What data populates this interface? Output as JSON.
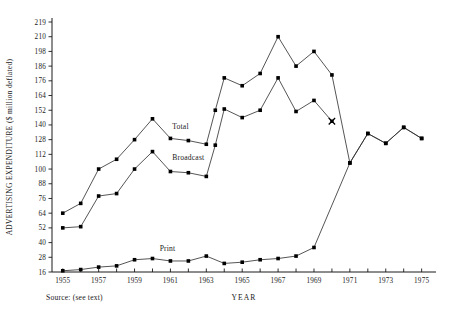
{
  "chart_data": {
    "type": "line",
    "title": "",
    "xlabel": "YEAR",
    "ylabel": "ADVERTISING EXPENDITURE ($ million deflated)",
    "source_note": "Source: (see text)",
    "grid": false,
    "legend_position": "inline-labels",
    "xlim": [
      1954.4,
      1975.8
    ],
    "ylim": [
      16,
      225
    ],
    "ytick_labels": [
      "16",
      "28",
      "40",
      "52",
      "64",
      "76",
      "88",
      "100",
      "112",
      "128",
      "140",
      "152",
      "164",
      "176",
      "186",
      "198",
      "210",
      "219"
    ],
    "ytick_values": [
      16,
      28,
      40,
      52,
      64,
      76,
      88,
      100,
      112,
      128,
      140,
      152,
      164,
      176,
      186,
      198,
      210,
      219
    ],
    "xtick_labels": [
      "1955",
      "1957",
      "1959",
      "1961",
      "1963",
      "1965",
      "1967",
      "1969",
      "1971",
      "1973",
      "1975"
    ],
    "xtick_values": [
      1955,
      1957,
      1959,
      1961,
      1963,
      1965,
      1967,
      1969,
      1971,
      1973,
      1975
    ],
    "x": [
      1955,
      1956,
      1957,
      1958,
      1959,
      1960,
      1961,
      1962,
      1963,
      1964,
      1965,
      1966,
      1967,
      1968,
      1969,
      1970,
      1971,
      1972,
      1973,
      1974,
      1975
    ],
    "series": [
      {
        "name": "Total",
        "label": "Total",
        "marker": "square",
        "values": [
          64,
          72,
          100,
          108,
          128,
          145,
          129,
          127,
          123,
          152,
          178,
          172,
          181,
          210,
          186,
          198,
          180,
          105,
          133,
          124,
          138,
          129
        ],
        "x_values": [
          1955,
          1956,
          1957,
          1958,
          1959,
          1960,
          1961,
          1962,
          1963,
          1963.5,
          1964,
          1965,
          1966,
          1967,
          1968,
          1969,
          1970,
          1971,
          1972,
          1973,
          1974,
          1975
        ]
      },
      {
        "name": "Broadcast",
        "label": "Broadcast",
        "marker": "square",
        "values": [
          52,
          53,
          78,
          80,
          100,
          115,
          98,
          97,
          94,
          122,
          153,
          146,
          152,
          178,
          151,
          160,
          143
        ],
        "x_values": [
          1955,
          1956,
          1957,
          1958,
          1959,
          1960,
          1961,
          1962,
          1963,
          1963.5,
          1964,
          1965,
          1966,
          1967,
          1968,
          1969,
          1970
        ],
        "end_marker": "x",
        "note": "series terminates at 1970"
      },
      {
        "name": "Print",
        "label": "Print",
        "marker": "square",
        "values": [
          17,
          18,
          20,
          21,
          26,
          27,
          25,
          25,
          29,
          23,
          24,
          26,
          27,
          29,
          36,
          105,
          133,
          124,
          138,
          129
        ],
        "x_values": [
          1955,
          1956,
          1957,
          1958,
          1959,
          1960,
          1961,
          1962,
          1963,
          1964,
          1965,
          1966,
          1967,
          1968,
          1969,
          1971,
          1972,
          1973,
          1974,
          1975
        ]
      }
    ],
    "annotations": [
      {
        "text": "Total",
        "x": 1961.1,
        "y": 137
      },
      {
        "text": "Broadcast",
        "x": 1961.1,
        "y": 107
      },
      {
        "text": "Print",
        "x": 1960.4,
        "y": 33
      }
    ],
    "colors": {
      "line": "#2a2a2a",
      "marker": "#000000",
      "axis": "#1a1a1a",
      "background": "#ffffff"
    }
  }
}
